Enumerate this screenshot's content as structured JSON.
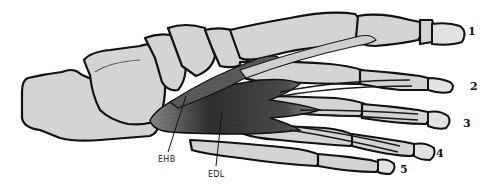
{
  "figure": {
    "muscle_labels": [
      {
        "id": "ehb",
        "text": "EHB"
      },
      {
        "id": "edl",
        "text": "EDL"
      }
    ],
    "toe_numbers": [
      "1",
      "2",
      "3",
      "4",
      "5"
    ],
    "colors": {
      "bone": "#d4d4d4",
      "outline": "#111111",
      "muscle": "#3a3a3a",
      "background": "#ffffff"
    }
  }
}
